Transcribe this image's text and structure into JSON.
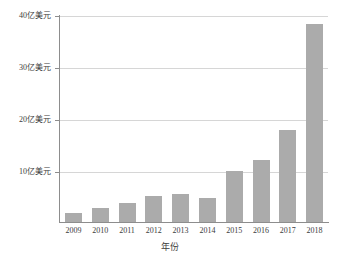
{
  "chart_data": {
    "type": "bar",
    "title": "",
    "subtitle": "",
    "xlabel": "年份",
    "ylabel": "",
    "categories": [
      "2009",
      "2010",
      "2011",
      "2012",
      "2013",
      "2014",
      "2015",
      "2016",
      "2017",
      "2018"
    ],
    "values": [
      1.7,
      2.7,
      3.7,
      5.0,
      5.4,
      4.6,
      10.0,
      12.0,
      17.8,
      38.5
    ],
    "series": [
      {
        "name": "",
        "values": [
          1.7,
          2.7,
          3.7,
          5.0,
          5.4,
          4.6,
          10.0,
          12.0,
          17.8,
          38.5
        ]
      }
    ],
    "ylim": [
      0,
      40
    ],
    "yticks": [
      10,
      20,
      30,
      40
    ],
    "ytick_labels": [
      "10亿美元",
      "20亿美元",
      "30亿美元",
      "40亿美元"
    ],
    "xtick_labels": [
      "2009",
      "2010",
      "2011",
      "2012",
      "2013",
      "2014",
      "2015",
      "2016",
      "2017",
      "2018"
    ],
    "grid": true,
    "grid_axis": "y",
    "legend": false,
    "legend_position": "none",
    "bar_color": "#ababab",
    "grid_color": "#d6d6d6",
    "axis_color": "#8d8d8d",
    "text_color": "#3c3c3c",
    "background_color": "#ffffff",
    "annotations": []
  },
  "axes": {
    "x_title": "年份",
    "y_ticks": [
      {
        "value": 40,
        "label": "40亿美元"
      },
      {
        "value": 30,
        "label": "30亿美元"
      },
      {
        "value": 20,
        "label": "20亿美元"
      },
      {
        "value": 10,
        "label": "10亿美元"
      }
    ],
    "x_ticks": [
      {
        "label": "2009"
      },
      {
        "label": "2010"
      },
      {
        "label": "2011"
      },
      {
        "label": "2012"
      },
      {
        "label": "2013"
      },
      {
        "label": "2014"
      },
      {
        "label": "2015"
      },
      {
        "label": "2016"
      },
      {
        "label": "2017"
      },
      {
        "label": "2018"
      }
    ]
  }
}
